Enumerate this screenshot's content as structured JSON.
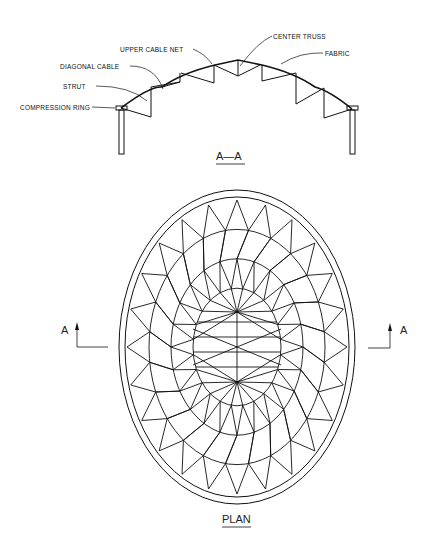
{
  "section": {
    "title": "A—A",
    "labels": {
      "upper_cable_net": "UPPER CABLE NET",
      "center_truss": "CENTER TRUSS",
      "fabric": "FABRIC",
      "diagonal_cable": "DIAGONAL CABLE",
      "strut": "STRUT",
      "compression_ring": "COMPRESSION RING"
    }
  },
  "plan": {
    "title": "PLAN",
    "section_marker_left": "A",
    "section_marker_right": "A"
  },
  "colors": {
    "line": "#111111",
    "background": "#ffffff"
  }
}
